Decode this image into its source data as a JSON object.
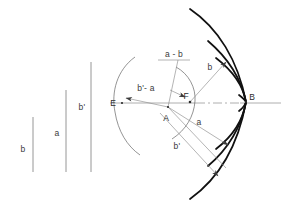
{
  "figure": {
    "background_color": "#ffffff",
    "stroke_color_thin": "#8c8c8c",
    "stroke_color_heavy": "#111111",
    "label_color": "#3a3a3a"
  },
  "scale_bars": {
    "caption": "Reference length bars",
    "items": [
      {
        "label": "b",
        "x": 33,
        "y_top": 117,
        "y_bottom": 172,
        "label_x": 23,
        "label_y": 150
      },
      {
        "label": "a",
        "x": 66,
        "y_top": 90,
        "y_bottom": 172,
        "label_x": 56,
        "label_y": 134
      },
      {
        "label": "b'",
        "x": 91,
        "y_top": 62,
        "y_bottom": 172,
        "label_x": 81,
        "label_y": 108
      }
    ]
  },
  "points": [
    {
      "name": "E",
      "label": "E",
      "x": 122,
      "y": 103,
      "label_x": 113,
      "label_y": 106
    },
    {
      "name": "A",
      "label": "A",
      "x": 168,
      "y": 107,
      "label_x": 164,
      "label_y": 120
    },
    {
      "name": "F",
      "label": "F",
      "x": 190,
      "y": 102,
      "label_x": 185,
      "label_y": 99
    },
    {
      "name": "B",
      "label": "B",
      "x": 248,
      "y": 102,
      "label_x": 249,
      "label_y": 100
    }
  ],
  "axis": {
    "name": "optical-axis",
    "x_start": 110,
    "x_end": 281,
    "y": 103,
    "dashdot_start": 196,
    "dashdot_end": 240
  },
  "ray_labels": [
    {
      "key": "a_minus_b",
      "text": "a - b",
      "x": 163,
      "y": 57
    },
    {
      "key": "bprime_minus_a",
      "text": "b'- a",
      "x": 140,
      "y": 89
    },
    {
      "key": "b",
      "text": "b",
      "x": 210,
      "y": 68
    },
    {
      "key": "a",
      "text": "a",
      "x": 198,
      "y": 124
    },
    {
      "key": "bprime",
      "text": "b'",
      "x": 176,
      "y": 147
    }
  ],
  "arcs": {
    "heavy_count": 4,
    "description": "Family of heavy caustic arcs converging at point B"
  }
}
